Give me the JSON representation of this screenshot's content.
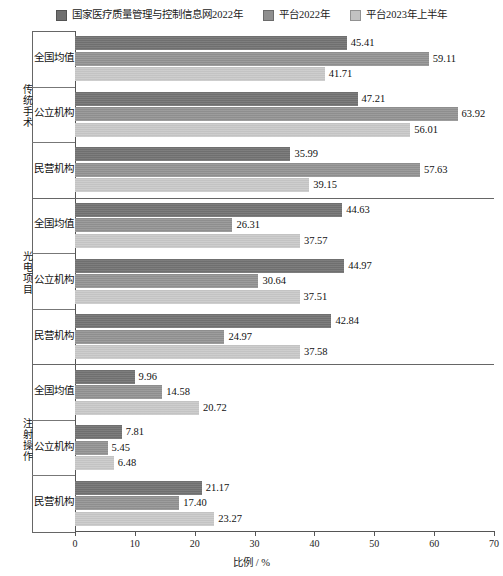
{
  "chart_data": {
    "type": "bar",
    "orientation": "horizontal",
    "title": "",
    "xlabel": "比例 / %",
    "ylabel": "",
    "xlim": [
      0,
      70
    ],
    "xticks": [
      0,
      10,
      20,
      30,
      40,
      50,
      60,
      70
    ],
    "grid": false,
    "legend_position": "top-center",
    "series": [
      {
        "name": "国家医疗质量管理与控制信息网2022年",
        "color": "#6f6f6f",
        "values": [
          45.41,
          47.21,
          35.99,
          44.63,
          44.97,
          42.84,
          9.96,
          7.81,
          21.17
        ]
      },
      {
        "name": "平台2022年",
        "color": "#8e8e8e",
        "values": [
          59.11,
          63.92,
          57.63,
          26.31,
          30.64,
          24.97,
          14.58,
          5.45,
          17.4
        ]
      },
      {
        "name": "平台2023年上半年",
        "color": "#c3c3c3",
        "values": [
          41.71,
          56.01,
          39.15,
          37.57,
          37.51,
          37.58,
          20.72,
          6.48,
          23.27
        ]
      }
    ],
    "sections": [
      {
        "label": "传统手术",
        "categories": [
          "全国均值",
          "公立机构",
          "民营机构"
        ],
        "rows": [
          {
            "category": "全国均值",
            "values": [
              45.41,
              59.11,
              41.71
            ]
          },
          {
            "category": "公立机构",
            "values": [
              47.21,
              63.92,
              56.01
            ]
          },
          {
            "category": "民营机构",
            "values": [
              35.99,
              57.63,
              39.15
            ]
          }
        ]
      },
      {
        "label": "光电项目",
        "categories": [
          "全国均值",
          "公立机构",
          "民营机构"
        ],
        "rows": [
          {
            "category": "全国均值",
            "values": [
              44.63,
              26.31,
              37.57
            ]
          },
          {
            "category": "公立机构",
            "values": [
              44.97,
              30.64,
              37.51
            ]
          },
          {
            "category": "民营机构",
            "values": [
              42.84,
              24.97,
              37.58
            ]
          }
        ]
      },
      {
        "label": "注射操作",
        "categories": [
          "全国均值",
          "公立机构",
          "民营机构"
        ],
        "rows": [
          {
            "category": "全国均值",
            "values": [
              9.96,
              14.58,
              20.72
            ]
          },
          {
            "category": "公立机构",
            "values": [
              7.81,
              5.45,
              6.48
            ]
          },
          {
            "category": "民营机构",
            "values": [
              21.17,
              17.4,
              23.27
            ]
          }
        ]
      }
    ]
  },
  "legend": {
    "items": [
      {
        "label": "国家医疗质量管理与控制信息网2022年",
        "color": "#6f6f6f"
      },
      {
        "label": "平台2022年",
        "color": "#8e8e8e"
      },
      {
        "label": "平台2023年上半年",
        "color": "#c3c3c3"
      }
    ]
  },
  "axis": {
    "x_label": "比例 / %",
    "x_ticks": [
      "0",
      "10",
      "20",
      "30",
      "40",
      "50",
      "60",
      "70"
    ]
  }
}
